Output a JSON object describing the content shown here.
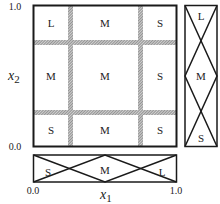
{
  "diagram": {
    "type": "fuzzy-partition-grid",
    "axes": {
      "x1": {
        "label": "x",
        "subscript": "1",
        "min_label": "0.0",
        "max_label": "1.0"
      },
      "x2": {
        "label": "x",
        "subscript": "2",
        "min_label": "0.0",
        "max_label": "1.0"
      }
    },
    "grid_cells": [
      {
        "row": 0,
        "col": 0,
        "label": "L"
      },
      {
        "row": 0,
        "col": 1,
        "label": "M"
      },
      {
        "row": 0,
        "col": 2,
        "label": "S"
      },
      {
        "row": 1,
        "col": 0,
        "label": "M"
      },
      {
        "row": 1,
        "col": 1,
        "label": "M"
      },
      {
        "row": 1,
        "col": 2,
        "label": "S"
      },
      {
        "row": 2,
        "col": 0,
        "label": "S"
      },
      {
        "row": 2,
        "col": 1,
        "label": "M"
      },
      {
        "row": 2,
        "col": 2,
        "label": "S"
      }
    ],
    "x1_membership": {
      "sets": [
        "S",
        "M",
        "L"
      ]
    },
    "x2_membership": {
      "sets": [
        "L",
        "M",
        "S"
      ]
    },
    "colors": {
      "line": "#1a1a1a",
      "hatch": "#8a8a8a",
      "background": "#ffffff"
    }
  }
}
